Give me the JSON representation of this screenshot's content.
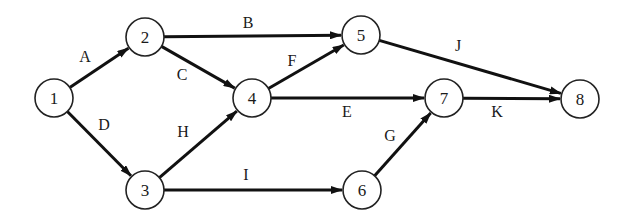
{
  "diagram": {
    "type": "activity-on-arrow network",
    "nodes": [
      {
        "id": "1",
        "label": "1",
        "x": 54,
        "y": 98
      },
      {
        "id": "2",
        "label": "2",
        "x": 145,
        "y": 37
      },
      {
        "id": "3",
        "label": "3",
        "x": 145,
        "y": 190
      },
      {
        "id": "4",
        "label": "4",
        "x": 252,
        "y": 98
      },
      {
        "id": "5",
        "label": "5",
        "x": 361,
        "y": 35
      },
      {
        "id": "6",
        "label": "6",
        "x": 362,
        "y": 190
      },
      {
        "id": "7",
        "label": "7",
        "x": 444,
        "y": 98
      },
      {
        "id": "8",
        "label": "8",
        "x": 580,
        "y": 99
      }
    ],
    "edges": [
      {
        "label": "A",
        "from": "1",
        "to": "2",
        "lx": 85,
        "ly": 62
      },
      {
        "label": "B",
        "from": "2",
        "to": "5",
        "lx": 248,
        "ly": 28
      },
      {
        "label": "C",
        "from": "2",
        "to": "4",
        "lx": 182,
        "ly": 80
      },
      {
        "label": "D",
        "from": "1",
        "to": "3",
        "lx": 104,
        "ly": 130
      },
      {
        "label": "E",
        "from": "4",
        "to": "7",
        "lx": 347,
        "ly": 117
      },
      {
        "label": "F",
        "from": "4",
        "to": "5",
        "lx": 292,
        "ly": 66
      },
      {
        "label": "G",
        "from": "6",
        "to": "7",
        "lx": 390,
        "ly": 141
      },
      {
        "label": "H",
        "from": "3",
        "to": "4",
        "lx": 183,
        "ly": 137
      },
      {
        "label": "I",
        "from": "3",
        "to": "6",
        "lx": 246,
        "ly": 180
      },
      {
        "label": "J",
        "from": "5",
        "to": "8",
        "lx": 458,
        "ly": 51
      },
      {
        "label": "K",
        "from": "7",
        "to": "8",
        "lx": 497,
        "ly": 117
      }
    ],
    "node_radius": 19,
    "colors": {
      "stroke": "#111111",
      "background": "#ffffff",
      "text": "#1a1a1a"
    }
  }
}
